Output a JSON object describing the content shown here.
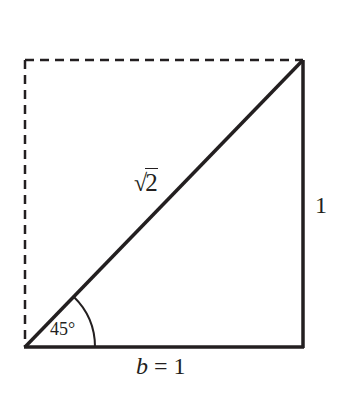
{
  "diagram": {
    "colors": {
      "stroke": "#231f20",
      "background": "#ffffff"
    },
    "points": {
      "bottom_left": [
        25,
        347
      ],
      "bottom_right": [
        303,
        347
      ],
      "top_right": [
        303,
        60
      ],
      "top_left": [
        25,
        60
      ]
    },
    "segments": [
      {
        "name": "base",
        "from": "bottom_left",
        "to": "bottom_right",
        "style": "solid"
      },
      {
        "name": "vertical-side",
        "from": "bottom_right",
        "to": "top_right",
        "style": "solid"
      },
      {
        "name": "hypotenuse",
        "from": "bottom_left",
        "to": "top_right",
        "style": "solid"
      },
      {
        "name": "top-edge",
        "from": "top_left",
        "to": "top_right",
        "style": "dashed"
      },
      {
        "name": "left-edge",
        "from": "top_left",
        "to": "bottom_left",
        "style": "dashed"
      }
    ],
    "labels": {
      "hypotenuse": {
        "radical": "√",
        "radicand": "2"
      },
      "vertical_side": "1",
      "base": {
        "variable": "b",
        "rest": " = 1"
      },
      "angle": "45°"
    },
    "angle_arc": {
      "vertex": "bottom_left",
      "radius": 70,
      "degrees": 45
    }
  }
}
